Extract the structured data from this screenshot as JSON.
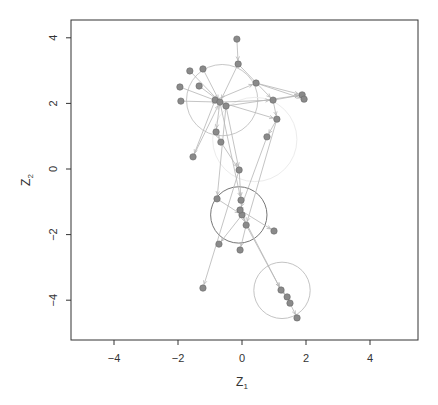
{
  "chart_data": {
    "type": "scatter",
    "subtype": "network-latent-space",
    "title": "",
    "xlabel": "Z1",
    "ylabel": "Z2",
    "xlim": [
      -5.4,
      5.4
    ],
    "ylim": [
      -5.2,
      4.6
    ],
    "xticks": [
      -4,
      -2,
      0,
      2,
      4
    ],
    "yticks": [
      -4,
      -2,
      0,
      2,
      4
    ],
    "grid": false,
    "legend": null,
    "nodes": [
      {
        "x": -0.16,
        "y": 3.96
      },
      {
        "x": -0.12,
        "y": 3.2
      },
      {
        "x": -1.63,
        "y": 2.99
      },
      {
        "x": -1.22,
        "y": 3.05
      },
      {
        "x": -1.94,
        "y": 2.5
      },
      {
        "x": -1.34,
        "y": 2.53
      },
      {
        "x": -1.91,
        "y": 2.07
      },
      {
        "x": -0.84,
        "y": 2.1
      },
      {
        "x": -0.69,
        "y": 2.04
      },
      {
        "x": -0.5,
        "y": 1.92
      },
      {
        "x": 0.44,
        "y": 2.62
      },
      {
        "x": 0.97,
        "y": 2.1
      },
      {
        "x": 1.88,
        "y": 2.26
      },
      {
        "x": 1.94,
        "y": 2.13
      },
      {
        "x": 1.09,
        "y": 1.52
      },
      {
        "x": 0.78,
        "y": 0.98
      },
      {
        "x": -0.81,
        "y": 1.13
      },
      {
        "x": -0.66,
        "y": 0.82
      },
      {
        "x": -1.53,
        "y": 0.37
      },
      {
        "x": -0.09,
        "y": -0.03
      },
      {
        "x": -0.03,
        "y": -0.95
      },
      {
        "x": -0.78,
        "y": -0.91
      },
      {
        "x": 0.0,
        "y": -1.4
      },
      {
        "x": 0.13,
        "y": -1.71
      },
      {
        "x": -0.06,
        "y": -1.25
      },
      {
        "x": 1.0,
        "y": -1.89
      },
      {
        "x": -0.72,
        "y": -2.29
      },
      {
        "x": -0.06,
        "y": -2.47
      },
      {
        "x": -1.22,
        "y": -3.63
      },
      {
        "x": 1.22,
        "y": -3.69
      },
      {
        "x": 1.41,
        "y": -3.9
      },
      {
        "x": 1.5,
        "y": -4.09
      },
      {
        "x": 1.72,
        "y": -4.54
      }
    ],
    "edges": [
      [
        0,
        1
      ],
      [
        1,
        8
      ],
      [
        2,
        8
      ],
      [
        3,
        8
      ],
      [
        4,
        8
      ],
      [
        5,
        9
      ],
      [
        6,
        8
      ],
      [
        7,
        10
      ],
      [
        8,
        11
      ],
      [
        9,
        12
      ],
      [
        10,
        13
      ],
      [
        11,
        12
      ],
      [
        8,
        14
      ],
      [
        14,
        15
      ],
      [
        10,
        12
      ],
      [
        8,
        16
      ],
      [
        16,
        17
      ],
      [
        17,
        19
      ],
      [
        9,
        19
      ],
      [
        18,
        8
      ],
      [
        19,
        20
      ],
      [
        20,
        22
      ],
      [
        21,
        22
      ],
      [
        22,
        23
      ],
      [
        24,
        25
      ],
      [
        22,
        26
      ],
      [
        23,
        27
      ],
      [
        19,
        28
      ],
      [
        22,
        29
      ],
      [
        29,
        30
      ],
      [
        30,
        31
      ],
      [
        31,
        32
      ],
      [
        15,
        24
      ],
      [
        14,
        23
      ],
      [
        8,
        20
      ],
      [
        9,
        21
      ],
      [
        7,
        18
      ],
      [
        1,
        11
      ],
      [
        11,
        14
      ],
      [
        23,
        29
      ]
    ],
    "clusters": [
      {
        "cx": -0.62,
        "cy": 2.1,
        "r": 1.1,
        "color": "#c8c8c8"
      },
      {
        "cx": 0.4,
        "cy": 0.9,
        "r": 1.3,
        "color": "#ececec"
      },
      {
        "cx": -0.1,
        "cy": -1.4,
        "r": 0.87,
        "color": "#777777"
      },
      {
        "cx": 1.25,
        "cy": -3.7,
        "r": 0.87,
        "color": "#c4c4c4"
      }
    ],
    "colors": {
      "node": "#8a8a8a",
      "node_stroke": "#6a6a6a",
      "edge": "#b5b5b5",
      "frame": "#333333"
    }
  },
  "axes": {
    "x_title_main": "Z",
    "x_title_sub": "1",
    "y_title_main": "Z",
    "y_title_sub": "2",
    "x_tick_labels": [
      "−4",
      "−2",
      "0",
      "2",
      "4"
    ],
    "y_tick_labels": [
      "−4",
      "−2",
      "0",
      "2",
      "4"
    ]
  }
}
